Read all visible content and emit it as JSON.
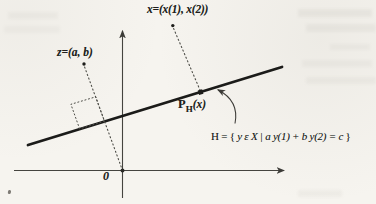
{
  "figure": {
    "labels": {
      "x_point": "x=(x(1), x(2))",
      "z_point": "z=(a, b)",
      "origin": "0",
      "projection": {
        "base": "P",
        "sub": "H",
        "arg": "(x)"
      },
      "hyperplane_set": {
        "h": "H",
        "eq": " = { ",
        "body": "y ε X | a y(1) + b y(2) = c",
        "close": " }"
      }
    },
    "colors": {
      "paper": "#f6f4ef",
      "ink": "#1b1b19",
      "axis": "#45443f",
      "dotted": "#4e4e48"
    }
  }
}
